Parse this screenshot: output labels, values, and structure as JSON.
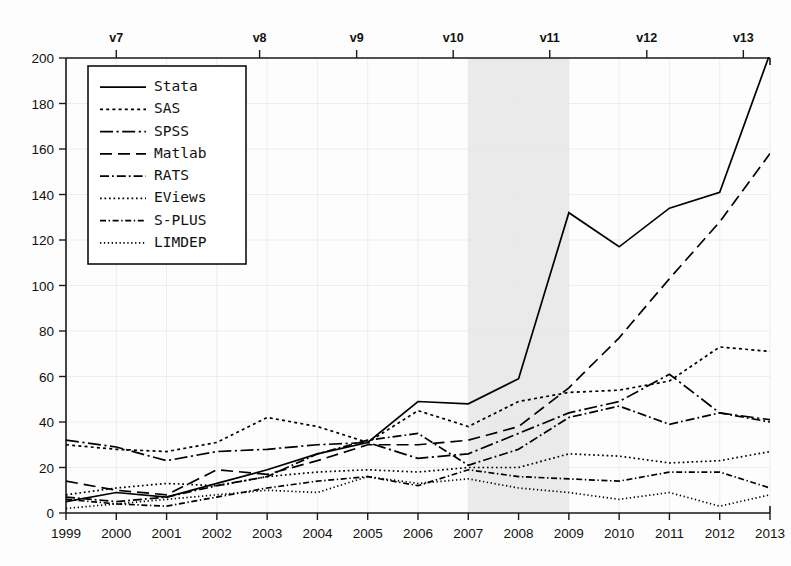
{
  "chart_data": {
    "type": "line",
    "title": "",
    "subtitle": "",
    "xlabel": "",
    "ylabel": "",
    "x": [
      1999,
      2000,
      2001,
      2002,
      2003,
      2004,
      2005,
      2006,
      2007,
      2008,
      2009,
      2010,
      2011,
      2012,
      2013
    ],
    "categories": [
      "1999",
      "2000",
      "2001",
      "2002",
      "2003",
      "2004",
      "2005",
      "2006",
      "2007",
      "2008",
      "2009",
      "2010",
      "2011",
      "2012",
      "2013"
    ],
    "xlim": [
      1999,
      2013
    ],
    "ylim": [
      0,
      200
    ],
    "yticks": [
      0,
      20,
      40,
      60,
      80,
      100,
      120,
      140,
      160,
      180,
      200
    ],
    "ytick_labels": [
      "0",
      "20",
      "40",
      "60",
      "80",
      "100",
      "120",
      "140",
      "160",
      "180",
      "200"
    ],
    "grid": false,
    "legend_position": "top-left",
    "top_axis": {
      "label_prefix": "v",
      "ticks": [
        {
          "label": "v7",
          "x": 2000.0
        },
        {
          "label": "v8",
          "x": 2002.85
        },
        {
          "label": "v9",
          "x": 2004.78
        },
        {
          "label": "v10",
          "x": 2006.7
        },
        {
          "label": "v11",
          "x": 2008.62
        },
        {
          "label": "v12",
          "x": 2010.55
        },
        {
          "label": "v13",
          "x": 2012.47
        }
      ]
    },
    "shaded_regions": [
      {
        "name": "recession",
        "x_start": 2007,
        "x_end": 2009,
        "color": "#e9e9e9"
      }
    ],
    "series": [
      {
        "name": "Stata",
        "dash": "solid",
        "values": [
          5,
          9,
          7,
          13,
          19,
          26,
          31,
          49,
          48,
          59,
          132,
          117,
          134,
          141,
          202
        ]
      },
      {
        "name": "SAS",
        "dash": "dotted",
        "values": [
          30,
          28,
          27,
          31,
          42,
          38,
          31,
          45,
          38,
          49,
          53,
          54,
          58,
          73,
          71
        ]
      },
      {
        "name": "SPSS",
        "dash": "dash-dot",
        "values": [
          32,
          29,
          23,
          27,
          28,
          30,
          31,
          24,
          26,
          35,
          44,
          49,
          61,
          44,
          41
        ]
      },
      {
        "name": "Matlab",
        "dash": "dashed",
        "values": [
          14,
          10,
          8,
          19,
          17,
          23,
          30,
          30,
          32,
          38,
          55,
          77,
          103,
          128,
          158
        ]
      },
      {
        "name": "RATS",
        "dash": "long-dash-dot",
        "values": [
          7,
          5,
          7,
          12,
          16,
          26,
          32,
          35,
          21,
          28,
          42,
          47,
          39,
          44,
          40
        ]
      },
      {
        "name": "EViews",
        "dash": "fine-dotted",
        "values": [
          8,
          11,
          13,
          12,
          16,
          18,
          19,
          18,
          20,
          20,
          26,
          25,
          22,
          23,
          27
        ]
      },
      {
        "name": "S-PLUS",
        "dash": "dash-dot-fine",
        "values": [
          6,
          4,
          3,
          7,
          11,
          14,
          16,
          12,
          19,
          16,
          15,
          14,
          18,
          18,
          11
        ]
      },
      {
        "name": "LIMDEP",
        "dash": "sparse-dotted",
        "values": [
          2,
          4,
          6,
          8,
          10,
          9,
          16,
          13,
          15,
          11,
          9,
          6,
          9,
          3,
          8
        ]
      }
    ],
    "legend_entries": [
      {
        "label": "Stata",
        "dash": "solid"
      },
      {
        "label": "SAS",
        "dash": "dotted"
      },
      {
        "label": "SPSS",
        "dash": "dash-dot"
      },
      {
        "label": "Matlab",
        "dash": "dashed"
      },
      {
        "label": "RATS",
        "dash": "long-dash-dot"
      },
      {
        "label": "EViews",
        "dash": "fine-dotted"
      },
      {
        "label": "S-PLUS",
        "dash": "dash-dot-fine"
      },
      {
        "label": "LIMDEP",
        "dash": "sparse-dotted"
      }
    ],
    "colors": {
      "line": "#000000",
      "axis": "#1a1a1a",
      "shading": "#e9e9e9",
      "background": "#fdfdfd"
    }
  }
}
